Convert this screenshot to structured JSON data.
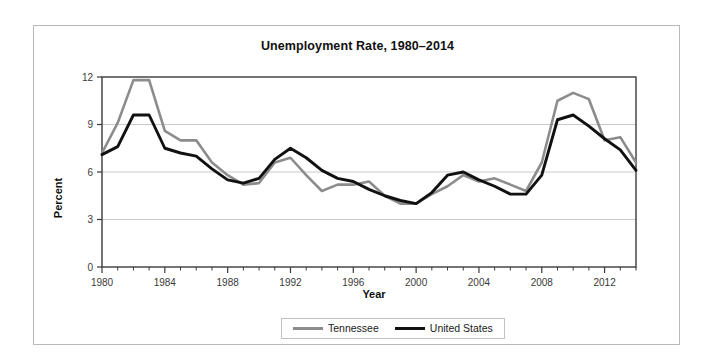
{
  "chart_data": {
    "type": "line",
    "title": "Unemployment Rate, 1980–2014",
    "xlabel": "Year",
    "ylabel": "Percent",
    "xlim": [
      1980,
      2014
    ],
    "ylim": [
      0,
      12
    ],
    "yticks": [
      0,
      3,
      6,
      9,
      12
    ],
    "ytick_labels": [
      "0",
      "3",
      "6",
      "9",
      "12"
    ],
    "xticks": [
      1980,
      1984,
      1988,
      1992,
      1996,
      2000,
      2004,
      2008,
      2012
    ],
    "xtick_labels": [
      "1980",
      "1984",
      "1988",
      "1992",
      "1996",
      "2000",
      "2004",
      "2008",
      "2012"
    ],
    "grid": "horizontal",
    "legend_position": "bottom-center",
    "x": [
      1980,
      1981,
      1982,
      1983,
      1984,
      1985,
      1986,
      1987,
      1988,
      1989,
      1990,
      1991,
      1992,
      1993,
      1994,
      1995,
      1996,
      1997,
      1998,
      1999,
      2000,
      2001,
      2002,
      2003,
      2004,
      2005,
      2006,
      2007,
      2008,
      2009,
      2010,
      2011,
      2012,
      2013,
      2014
    ],
    "series": [
      {
        "name": "Tennessee",
        "color": "#8c8c8c",
        "values": [
          7.2,
          9.1,
          11.8,
          11.8,
          8.6,
          8.0,
          8.0,
          6.6,
          5.8,
          5.2,
          5.3,
          6.6,
          6.9,
          5.8,
          4.8,
          5.2,
          5.2,
          5.4,
          4.5,
          4.0,
          4.0,
          4.6,
          5.1,
          5.8,
          5.4,
          5.6,
          5.2,
          4.8,
          6.6,
          10.5,
          11.0,
          10.6,
          8.0,
          8.2,
          6.6
        ]
      },
      {
        "name": "United States",
        "color": "#111111",
        "values": [
          7.1,
          7.6,
          9.6,
          9.6,
          7.5,
          7.2,
          7.0,
          6.2,
          5.5,
          5.3,
          5.6,
          6.8,
          7.5,
          6.9,
          6.1,
          5.6,
          5.4,
          4.9,
          4.5,
          4.2,
          4.0,
          4.7,
          5.8,
          6.0,
          5.5,
          5.1,
          4.6,
          4.6,
          5.8,
          9.3,
          9.6,
          8.9,
          8.1,
          7.4,
          6.1
        ]
      }
    ]
  },
  "legend": {
    "items": [
      {
        "label": "Tennessee"
      },
      {
        "label": "United States"
      }
    ]
  }
}
